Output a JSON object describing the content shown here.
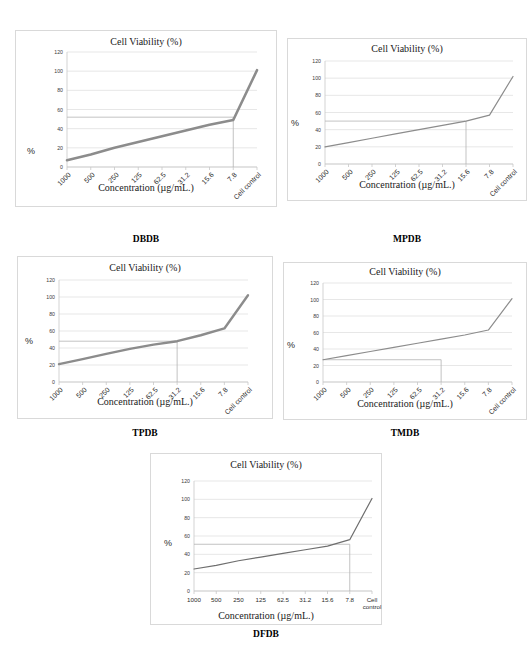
{
  "figure": {
    "caption_font_note": "",
    "panels": [
      {
        "id": "dbdb",
        "caption": "DBDB",
        "chart_data": {
          "type": "line",
          "title": "Cell Viability (%)",
          "xlabel": "Concentration (µg/mL.)",
          "ylabel": "%",
          "categories": [
            "1000",
            "500",
            "250",
            "125",
            "62.5",
            "31.2",
            "15.6",
            "7.8",
            "Cell control"
          ],
          "values": [
            7,
            13,
            20,
            26,
            32,
            38,
            44,
            49,
            101
          ],
          "ylim": [
            0,
            120
          ],
          "yticks": [
            0,
            20,
            40,
            60,
            80,
            100,
            120
          ],
          "grid": true,
          "legend": "none",
          "line_color": "#8c8c8c",
          "line_width": 2.6,
          "tick_rotation": -45,
          "annotations": {
            "ic50_horizontal_y": 52,
            "ic50_vertical_category": "7.8"
          }
        }
      },
      {
        "id": "mpdb",
        "caption": "MPDB",
        "chart_data": {
          "type": "line",
          "title": "Cell Viability (%)",
          "xlabel": "Concentration (µg/mL.)",
          "ylabel": "%",
          "categories": [
            "1000",
            "500",
            "250",
            "125",
            "62.5",
            "31.2",
            "15.6",
            "7.8",
            "Cell control"
          ],
          "values": [
            20,
            25,
            30,
            35,
            40,
            45,
            50,
            57,
            102
          ],
          "ylim": [
            0,
            120
          ],
          "yticks": [
            0,
            20,
            40,
            60,
            80,
            100,
            120
          ],
          "grid": true,
          "legend": "none",
          "line_color": "#8c8c8c",
          "line_width": 1.2,
          "tick_rotation": -45,
          "annotations": {
            "ic50_horizontal_y": 50,
            "ic50_vertical_category": "15.6"
          }
        }
      },
      {
        "id": "tpdb",
        "caption": "TPDB",
        "chart_data": {
          "type": "line",
          "title": "Cell Viability (%)",
          "xlabel": "Concentration (µg/mL.)",
          "ylabel": "%",
          "categories": [
            "1000",
            "500",
            "250",
            "125",
            "62.5",
            "31.2",
            "15.6",
            "7.8",
            "Cell control"
          ],
          "values": [
            21,
            27,
            33,
            39,
            44,
            48,
            55,
            63,
            102
          ],
          "ylim": [
            0,
            120
          ],
          "yticks": [
            0,
            20,
            40,
            60,
            80,
            100,
            120
          ],
          "grid": true,
          "legend": "none",
          "line_color": "#8c8c8c",
          "line_width": 2.4,
          "tick_rotation": -45,
          "annotations": {
            "ic50_horizontal_y": 48,
            "ic50_vertical_category": "31.2"
          }
        }
      },
      {
        "id": "tmdb",
        "caption": "TMDB",
        "chart_data": {
          "type": "line",
          "title": "Cell Viability (%)",
          "xlabel": "Concentration (µg/mL.)",
          "ylabel": "%",
          "categories": [
            "1000",
            "500",
            "250",
            "125",
            "62.5",
            "31.2",
            "15.6",
            "7.8",
            "Cell control"
          ],
          "values": [
            27,
            32,
            37,
            42,
            47,
            52,
            57,
            63,
            101
          ],
          "ylim": [
            0,
            120
          ],
          "yticks": [
            0,
            20,
            40,
            60,
            80,
            100,
            120
          ],
          "grid": true,
          "legend": "none",
          "line_color": "#8c8c8c",
          "line_width": 1.2,
          "tick_rotation": -45,
          "annotations": {
            "ic50_horizontal_y": 27,
            "ic50_vertical_category": "31.2"
          }
        }
      },
      {
        "id": "dfdb",
        "caption": "DFDB",
        "chart_data": {
          "type": "line",
          "title": "Cell Viability (%)",
          "xlabel": "Concentration (µg/mL.)",
          "ylabel": "%",
          "categories": [
            "1000",
            "500",
            "250",
            "125",
            "62.5",
            "31.2",
            "15.6",
            "7.8",
            "Cell control"
          ],
          "values": [
            24,
            28,
            33,
            37,
            41,
            45,
            49,
            56,
            101
          ],
          "ylim": [
            0,
            120
          ],
          "yticks": [
            0,
            20,
            40,
            60,
            80,
            100,
            120
          ],
          "grid": true,
          "legend": "none",
          "line_color": "#6e6e6e",
          "line_width": 1.2,
          "tick_rotation": 0,
          "annotations": {
            "ic50_horizontal_y": 51,
            "ic50_vertical_category": "7.8"
          }
        }
      }
    ]
  }
}
